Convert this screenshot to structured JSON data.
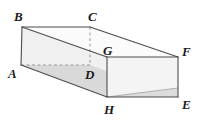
{
  "figure": {
    "name": "rectangular-prism",
    "colors": {
      "edge": "#4d4d4d",
      "hidden_edge": "#8c8c8c",
      "face_top": "#fbfbfb",
      "face_left": "#f2f2f2",
      "face_front_upper": "#ededed",
      "face_front_lower": "#d9d9d9",
      "face_bottom": "#d6d6d6",
      "label": "#1a1a1a",
      "background": "#ffffff"
    },
    "vertices": [
      {
        "id": "B",
        "label": "B",
        "x": 22,
        "y": 27,
        "label_x": 14,
        "label_y": 20,
        "hidden": false
      },
      {
        "id": "C",
        "label": "C",
        "x": 90,
        "y": 27,
        "label_x": 90,
        "label_y": 20,
        "hidden": false
      },
      {
        "id": "A",
        "label": "A",
        "x": 21,
        "y": 65,
        "label_x": 11,
        "label_y": 78,
        "hidden": false
      },
      {
        "id": "D",
        "label": "D",
        "x": 90,
        "y": 65,
        "label_x": 86,
        "label_y": 79,
        "hidden": true
      },
      {
        "id": "G",
        "label": "G",
        "x": 107,
        "y": 57,
        "label_x": 104,
        "label_y": 55,
        "hidden": false
      },
      {
        "id": "F",
        "label": "F",
        "x": 178,
        "y": 57,
        "label_x": 183,
        "label_y": 56,
        "hidden": false
      },
      {
        "id": "H",
        "label": "H",
        "x": 107,
        "y": 97,
        "label_x": 106,
        "label_y": 114,
        "hidden": false
      },
      {
        "id": "E",
        "label": "E",
        "x": 178,
        "y": 97,
        "label_x": 183,
        "label_y": 109,
        "hidden": false
      }
    ],
    "edges": [
      {
        "from": "B",
        "to": "C",
        "style": "solid"
      },
      {
        "from": "B",
        "to": "A",
        "style": "solid"
      },
      {
        "from": "B",
        "to": "G",
        "style": "solid"
      },
      {
        "from": "C",
        "to": "F",
        "style": "solid"
      },
      {
        "from": "C",
        "to": "D",
        "style": "dashed"
      },
      {
        "from": "A",
        "to": "D",
        "style": "dashed"
      },
      {
        "from": "A",
        "to": "H",
        "style": "solid"
      },
      {
        "from": "G",
        "to": "F",
        "style": "solid"
      },
      {
        "from": "G",
        "to": "H",
        "style": "solid"
      },
      {
        "from": "F",
        "to": "E",
        "style": "solid"
      },
      {
        "from": "H",
        "to": "E",
        "style": "solid"
      },
      {
        "from": "H",
        "to": "F",
        "style": "dashed"
      }
    ],
    "labels": {
      "B": "B",
      "C": "C",
      "A": "A",
      "D": "D",
      "G": "G",
      "F": "F",
      "H": "H",
      "E": "E"
    }
  }
}
